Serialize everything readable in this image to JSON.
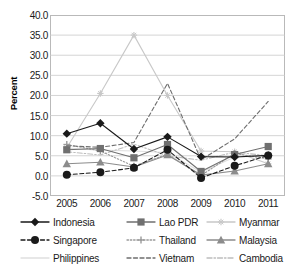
{
  "chart_data": {
    "type": "line",
    "title": "",
    "xlabel": "",
    "ylabel": "Percent",
    "categories": [
      "2005",
      "2006",
      "2007",
      "2008",
      "2009",
      "2010",
      "2011"
    ],
    "ylim": [
      -5.0,
      40.0
    ],
    "ytick_step": 5.0,
    "ytick_labels": [
      "40.0",
      "35.0",
      "30.0",
      "25.0",
      "20.0",
      "15.0",
      "10.0",
      "5.0",
      "0.0",
      "-5.0"
    ],
    "ytick_values": [
      40.0,
      35.0,
      30.0,
      25.0,
      20.0,
      15.0,
      10.0,
      5.0,
      0.0,
      -5.0
    ],
    "grid": true,
    "legend_position": "bottom",
    "series": [
      {
        "name": "Indonesia",
        "color": "#1a1a1a",
        "marker": "diamond",
        "dash": "solid",
        "values": [
          10.5,
          13.1,
          6.7,
          9.7,
          4.8,
          4.7,
          5.1
        ]
      },
      {
        "name": "Lao PDR",
        "color": "#707070",
        "marker": "square",
        "dash": "solid",
        "values": [
          6.5,
          6.8,
          4.5,
          7.8,
          1.1,
          5.3,
          7.3
        ]
      },
      {
        "name": "Myanmar",
        "color": "#c8c8c8",
        "marker": "star",
        "dash": "solid",
        "values": [
          7.0,
          20.5,
          35.0,
          20.0,
          6.2,
          6.0,
          3.0
        ]
      },
      {
        "name": "Singapore",
        "color": "#1a1a1a",
        "marker": "circle",
        "dash": "dashed",
        "values": [
          0.3,
          0.9,
          2.0,
          6.5,
          -0.5,
          2.5,
          5.1
        ]
      },
      {
        "name": "Thailand",
        "color": "#9a9a9a",
        "marker": "plus",
        "dash": "dotted",
        "values": [
          7.8,
          6.2,
          2.4,
          5.4,
          0.1,
          5.6,
          4.2
        ]
      },
      {
        "name": "Malaysia",
        "color": "#8c8c8c",
        "marker": "triangle",
        "dash": "solid",
        "values": [
          3.0,
          3.4,
          2.2,
          5.2,
          0.2,
          1.2,
          3.0
        ]
      },
      {
        "name": "Philippines",
        "color": "#e0e0e0",
        "marker": "none",
        "dash": "solid",
        "values": [
          6.9,
          6.4,
          6.2,
          5.8,
          0.9,
          4.7,
          4.9
        ]
      },
      {
        "name": "Vietnam",
        "color": "#6e6e6e",
        "marker": "none",
        "dash": "dashed",
        "values": [
          7.5,
          7.1,
          8.3,
          23.0,
          4.0,
          9.2,
          18.5
        ]
      },
      {
        "name": "Cambodia",
        "color": "#bdbdbd",
        "marker": "none",
        "dash": "dashdot",
        "values": [
          6.0,
          5.2,
          7.9,
          5.0,
          3.9,
          5.9,
          5.0
        ]
      }
    ]
  },
  "legend": {
    "rows": [
      [
        "Indonesia",
        "Lao PDR",
        "Myanmar"
      ],
      [
        "Singapore",
        "Thailand",
        "Malaysia"
      ],
      [
        "Philippines",
        "Vietnam",
        "Cambodia"
      ]
    ]
  }
}
